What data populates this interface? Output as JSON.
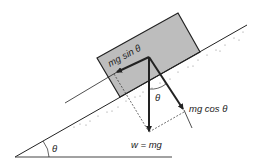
{
  "diagram": {
    "colors": {
      "block_fill": "#bdbdbd",
      "line": "#222222",
      "dashed": "#333333",
      "background": "#ffffff"
    },
    "labels": {
      "parallel_force": "mg sin θ",
      "perpendicular_force": "mg cos θ",
      "weight": "w = mg",
      "angle_between_weight_and_normal": "θ",
      "incline_angle": "θ"
    },
    "elements": [
      {
        "id": "incline-surface",
        "type": "line",
        "from": [
          15,
          157
        ],
        "to": [
          247,
          25
        ]
      },
      {
        "id": "ground-baseline",
        "type": "line",
        "from": [
          15,
          157
        ],
        "to": [
          172,
          157
        ]
      },
      {
        "id": "block",
        "type": "polygon",
        "points": [
          [
            97,
            58
          ],
          [
            178,
            13
          ],
          [
            200,
            52
          ],
          [
            120,
            97
          ]
        ]
      },
      {
        "id": "force-parallel",
        "type": "arrow",
        "from": [
          149,
          57
        ],
        "to": [
          117,
          72
        ],
        "label": "mg sin θ"
      },
      {
        "id": "force-weight",
        "type": "arrow",
        "from": [
          149,
          57
        ],
        "to": [
          149,
          132
        ],
        "label": "w = mg"
      },
      {
        "id": "force-perpendicular",
        "type": "arrow",
        "from": [
          149,
          57
        ],
        "to": [
          184,
          110
        ],
        "label": "mg cos θ"
      }
    ]
  }
}
